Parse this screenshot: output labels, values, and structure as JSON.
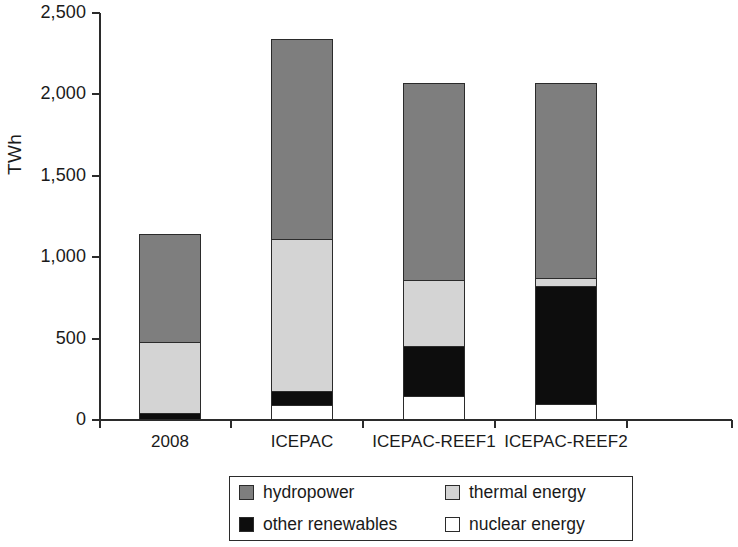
{
  "chart_data": {
    "type": "bar",
    "stacked": true,
    "title": "",
    "xlabel": "",
    "ylabel": "TWh",
    "ylim": [
      0,
      2500
    ],
    "ytick_labels": [
      "0",
      "500",
      "1,000",
      "1,500",
      "2,000",
      "2,500"
    ],
    "yticks": [
      0,
      500,
      1000,
      1500,
      2000,
      2500
    ],
    "grid": false,
    "legend_position": "bottom-center",
    "categories": [
      "2008",
      "ICEPAC",
      "ICEPAC-REEF1",
      "ICEPAC-REEF2"
    ],
    "series": [
      {
        "name": "nuclear energy",
        "color": "#ffffff",
        "values": [
          0,
          90,
          145,
          100
        ]
      },
      {
        "name": "other renewables",
        "color": "#0d0d0d",
        "values": [
          45,
          90,
          310,
          725
        ]
      },
      {
        "name": "thermal energy",
        "color": "#d4d4d4",
        "values": [
          435,
          930,
          405,
          50
        ]
      },
      {
        "name": "hydropower",
        "color": "#7e7e7e",
        "values": [
          660,
          1230,
          1210,
          1195
        ]
      }
    ],
    "totals": [
      1140,
      2340,
      2070,
      2070
    ],
    "legend": [
      {
        "label": "hydropower",
        "color": "#7e7e7e"
      },
      {
        "label": "thermal energy",
        "color": "#d4d4d4"
      },
      {
        "label": "other renewables",
        "color": "#0d0d0d"
      },
      {
        "label": "nuclear energy",
        "color": "#ffffff"
      }
    ]
  }
}
